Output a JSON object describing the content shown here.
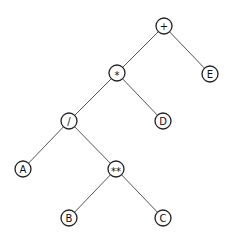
{
  "tree": {
    "nodes": [
      {
        "id": "plus",
        "label": "+",
        "x": 164,
        "y": 26
      },
      {
        "id": "mul",
        "label": "*",
        "x": 117,
        "y": 73
      },
      {
        "id": "E",
        "label": "E",
        "x": 210,
        "y": 74
      },
      {
        "id": "div",
        "label": "/",
        "x": 69,
        "y": 121
      },
      {
        "id": "D",
        "label": "D",
        "x": 163,
        "y": 121
      },
      {
        "id": "A",
        "label": "A",
        "x": 23,
        "y": 169
      },
      {
        "id": "pow",
        "label": "**",
        "x": 116,
        "y": 169
      },
      {
        "id": "B",
        "label": "B",
        "x": 69,
        "y": 218
      },
      {
        "id": "C",
        "label": "C",
        "x": 163,
        "y": 218
      }
    ],
    "edges": [
      [
        "plus",
        "mul"
      ],
      [
        "plus",
        "E"
      ],
      [
        "mul",
        "div"
      ],
      [
        "mul",
        "D"
      ],
      [
        "div",
        "A"
      ],
      [
        "div",
        "pow"
      ],
      [
        "pow",
        "B"
      ],
      [
        "pow",
        "C"
      ]
    ],
    "node_radius": 8
  }
}
